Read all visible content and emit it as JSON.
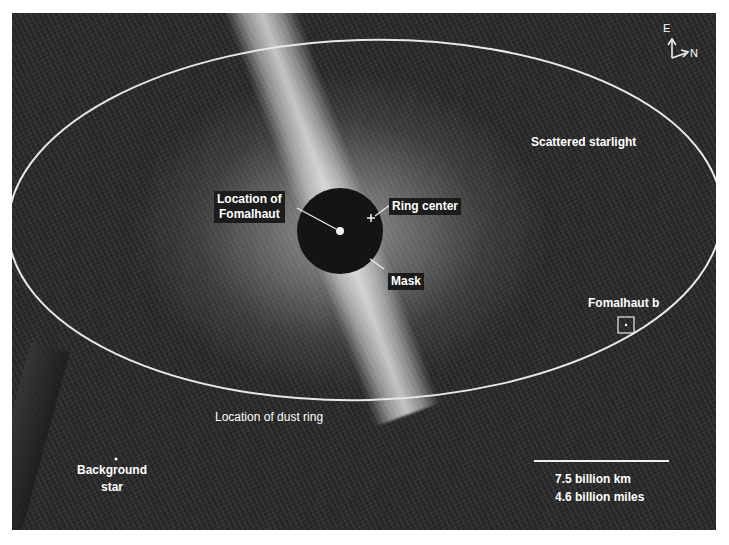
{
  "image": {
    "subject": "Fomalhaut dust ring",
    "background_color": "#262626",
    "overlay_color": "#ffffff"
  },
  "labels": {
    "scattered_starlight": "Scattered starlight",
    "location_of_fomalhaut": [
      "Location of",
      "Fomalhaut"
    ],
    "ring_center": "Ring center",
    "mask": "Mask",
    "fomalhaut_b": "Fomalhaut b",
    "dust_ring": "Location of dust ring",
    "background_star": [
      "Background",
      "star"
    ]
  },
  "compass": {
    "east": "E",
    "north": "N"
  },
  "scale_bar": {
    "km": "7.5 billion km",
    "miles": "4.6 billion miles"
  }
}
